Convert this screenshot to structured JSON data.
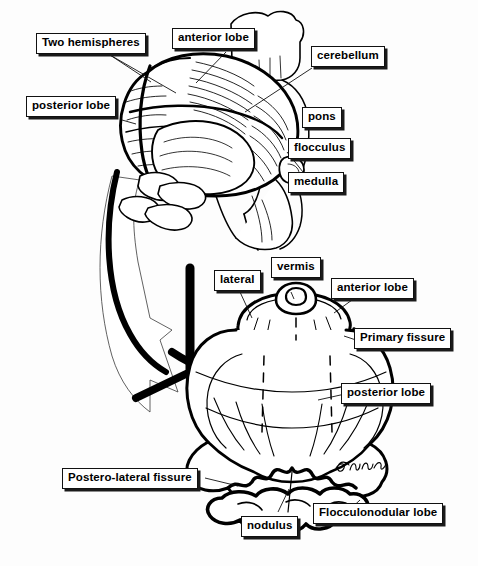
{
  "figure": {
    "kind": "anatomical-line-diagram",
    "background_color": "#fdfdfd",
    "ink_color": "#000000",
    "artist_signature": "Guyfnu"
  },
  "upper_view": {
    "name": "Posterior-superior oblique view of cerebellum and brainstem",
    "labels": [
      {
        "id": "two-hemispheres",
        "text": "Two hemispheres"
      },
      {
        "id": "anterior-lobe-top",
        "text": "anterior lobe"
      },
      {
        "id": "cerebellum",
        "text": "cerebellum"
      },
      {
        "id": "posterior-lobe-top",
        "text": "posterior lobe"
      },
      {
        "id": "pons",
        "text": "pons"
      },
      {
        "id": "flocculus",
        "text": "flocculus"
      },
      {
        "id": "medulla",
        "text": "medulla"
      }
    ]
  },
  "lower_view": {
    "name": "Unfolded / flattened posterior view of cerebellum",
    "labels": [
      {
        "id": "lateral",
        "text": "lateral"
      },
      {
        "id": "vermis",
        "text": "vermis"
      },
      {
        "id": "anterior-lobe-bottom",
        "text": "anterior lobe"
      },
      {
        "id": "primary-fissure",
        "text": "Primary fissure"
      },
      {
        "id": "posterior-lobe-bottom",
        "text": "posterior lobe"
      },
      {
        "id": "postero-lateral-fissure",
        "text": "Postero-lateral fissure"
      },
      {
        "id": "nodulus",
        "text": "nodulus"
      },
      {
        "id": "flocculonodular-lobe",
        "text": "Flocculonodular lobe"
      }
    ]
  },
  "caption": {
    "text": "",
    "note": "bottom caption line is cropped / illegible"
  }
}
